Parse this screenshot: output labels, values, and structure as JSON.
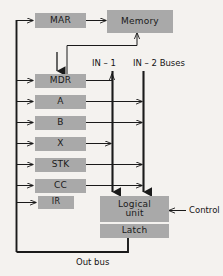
{
  "diagram": {
    "background_color": "#f4f2ef",
    "box_fill_color": "#a9a9a9",
    "line_color": "#1a1a1a",
    "boxes": {
      "mar": "MAR",
      "memory": "Memory",
      "mdr": "MDR",
      "a": "A",
      "b": "B",
      "x": "X",
      "stk": "STK",
      "cc": "CC",
      "ir": "IR",
      "logical_unit_line1": "Logical",
      "logical_unit_line2": "unit",
      "latch": "Latch"
    },
    "labels": {
      "in1": "IN – 1",
      "in2_buses": "IN – 2 Buses",
      "control": "Control",
      "out_bus": "Out bus"
    }
  }
}
